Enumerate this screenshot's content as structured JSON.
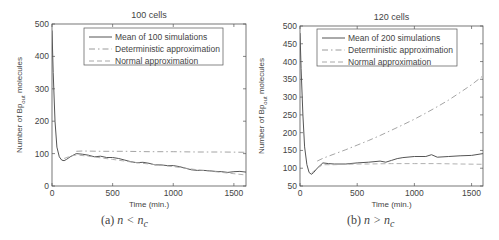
{
  "chart_data": [
    {
      "type": "line",
      "title": "100 cells",
      "xlabel": "Time (min.)",
      "ylabel": "Number of Bp_out molecules",
      "ylabel_main": "Number of Bp",
      "ylabel_sub": "out",
      "ylabel_tail": " molecules",
      "xlim": [
        0,
        1600
      ],
      "ylim": [
        0,
        500
      ],
      "xticks": [
        0,
        500,
        1000,
        1500
      ],
      "yticks": [
        0,
        100,
        200,
        300,
        400,
        500
      ],
      "grid": false,
      "legend_position": "upper right",
      "caption": "(a) n < n_c",
      "caption_prefix": "(a) ",
      "caption_math": "n < n",
      "caption_sub": "c",
      "series": [
        {
          "name": "Mean of 100 simulations",
          "style": "solid",
          "x": [
            0,
            10,
            25,
            40,
            60,
            80,
            100,
            120,
            150,
            200,
            250,
            300,
            350,
            400,
            450,
            500,
            550,
            600,
            650,
            700,
            750,
            800,
            850,
            900,
            950,
            1000,
            1050,
            1100,
            1150,
            1200,
            1250,
            1300,
            1350,
            1400,
            1450,
            1500,
            1550,
            1600
          ],
          "y": [
            480,
            350,
            200,
            120,
            90,
            80,
            78,
            82,
            90,
            100,
            98,
            95,
            90,
            92,
            88,
            88,
            85,
            80,
            75,
            72,
            73,
            70,
            65,
            65,
            63,
            63,
            60,
            55,
            50,
            48,
            48,
            47,
            45,
            44,
            42,
            44,
            45,
            43
          ]
        },
        {
          "name": "Deterministic approximation",
          "style": "dashdot",
          "x": [
            200,
            250,
            400,
            600,
            800,
            1000,
            1200,
            1400,
            1600
          ],
          "y": [
            107,
            108,
            107,
            107,
            106,
            106,
            105,
            105,
            104
          ]
        },
        {
          "name": "Normal approximation",
          "style": "dashed",
          "x": [
            100,
            150,
            200,
            300,
            400,
            500,
            600,
            700,
            800,
            900,
            1000,
            1100,
            1200,
            1300,
            1400,
            1500,
            1600
          ],
          "y": [
            85,
            92,
            96,
            92,
            87,
            82,
            77,
            72,
            68,
            64,
            60,
            55,
            50,
            46,
            42,
            38,
            34
          ]
        }
      ]
    },
    {
      "type": "line",
      "title": "120 cells",
      "xlabel": "Time (min.)",
      "ylabel": "Number of Bp_out molecules",
      "ylabel_main": "Number of Bp",
      "ylabel_sub": "out",
      "ylabel_tail": " molecules",
      "xlim": [
        0,
        1600
      ],
      "ylim": [
        50,
        500
      ],
      "xticks": [
        0,
        500,
        1000,
        1500
      ],
      "yticks": [
        50,
        100,
        150,
        200,
        250,
        300,
        350,
        400,
        450,
        500
      ],
      "grid": false,
      "legend_position": "upper right",
      "caption": "(b) n > n_c",
      "caption_prefix": "(b) ",
      "caption_math": "n > n",
      "caption_sub": "c",
      "series": [
        {
          "name": "Mean of 200 simulations",
          "style": "solid",
          "x": [
            0,
            10,
            25,
            40,
            60,
            80,
            100,
            120,
            150,
            200,
            250,
            300,
            400,
            500,
            600,
            700,
            750,
            800,
            850,
            900,
            1000,
            1100,
            1150,
            1200,
            1300,
            1400,
            1500,
            1600
          ],
          "y": [
            480,
            380,
            250,
            160,
            110,
            88,
            83,
            88,
            100,
            115,
            113,
            112,
            112,
            115,
            117,
            120,
            117,
            122,
            127,
            130,
            133,
            133,
            138,
            131,
            133,
            135,
            136,
            141
          ]
        },
        {
          "name": "Deterministic approximation",
          "style": "dashdot",
          "x": [
            150,
            200,
            300,
            400,
            500,
            600,
            700,
            800,
            900,
            1000,
            1100,
            1200,
            1300,
            1400,
            1500,
            1600
          ],
          "y": [
            120,
            128,
            140,
            152,
            165,
            178,
            192,
            207,
            222,
            238,
            255,
            273,
            292,
            313,
            335,
            360
          ]
        },
        {
          "name": "Normal approximation",
          "style": "dashed",
          "x": [
            100,
            150,
            200,
            300,
            400,
            500,
            600,
            800,
            1000,
            1200,
            1400,
            1600
          ],
          "y": [
            86,
            100,
            110,
            110,
            111,
            112,
            112,
            113,
            113,
            113,
            112,
            111
          ]
        }
      ]
    }
  ]
}
